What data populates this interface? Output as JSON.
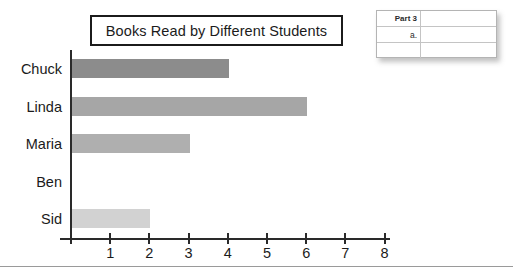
{
  "chart_data": {
    "type": "bar",
    "orientation": "horizontal",
    "title": "Books Read by Different Students",
    "categories": [
      "Chuck",
      "Linda",
      "Maria",
      "Ben",
      "Sid"
    ],
    "values": [
      4,
      6,
      3,
      0,
      2
    ],
    "bar_colors": [
      "#8c8c8c",
      "#a6a6a6",
      "#afafaf",
      "#ffffff",
      "#d2d2d2"
    ],
    "xlabel": "",
    "ylabel": "",
    "xlim": [
      0,
      8
    ],
    "xticks": [
      0,
      1,
      2,
      3,
      4,
      5,
      6,
      7,
      8
    ],
    "xtick_labels": [
      "",
      "1",
      "2",
      "3",
      "4",
      "5",
      "6",
      "7",
      "8"
    ],
    "grid": false,
    "legend": null
  },
  "answer_table": {
    "rows": [
      {
        "label": "Part 3",
        "value": ""
      },
      {
        "label": "a.",
        "value": ""
      },
      {
        "label": "",
        "value": ""
      }
    ]
  },
  "colors": {
    "axis": "#2a2a2a",
    "text": "#1b1b1b",
    "title_border": "#1b1b1b",
    "table_border": "#b4b4b4",
    "footer_rule": "#9a9a9a"
  }
}
